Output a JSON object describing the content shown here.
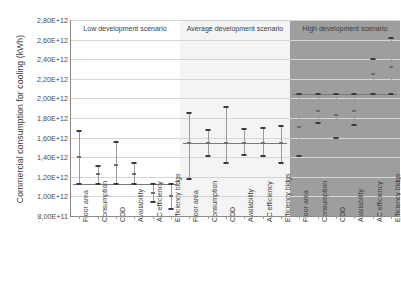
{
  "chart_data": {
    "type": "bar",
    "title": "",
    "xlabel": "",
    "ylabel": "Commercial consumption for cooling (kWh)",
    "ylim": [
      800000000000.0,
      2800000000000.0
    ],
    "ytick_labels": [
      "2,80E+12",
      "2,60E+12",
      "2,40E+12",
      "2,20E+12",
      "2,00E+12",
      "1,80E+12",
      "1,60E+12",
      "1,40E+12",
      "1,20E+12",
      "1,00E+12",
      "8,00E+11"
    ],
    "ytick_values": [
      2800000000000.0,
      2600000000000.0,
      2400000000000.0,
      2200000000000.0,
      2000000000000.0,
      1800000000000.0,
      1600000000000.0,
      1400000000000.0,
      1200000000000.0,
      1000000000000.0,
      800000000000.0
    ],
    "grid": true,
    "legend": "none",
    "categories": [
      "Floor area",
      "Consumption",
      "CDD",
      "Availability",
      "AC efficiency",
      "Efficiency bldgs"
    ],
    "panels": [
      {
        "name": "low",
        "label": "Low development scenario",
        "background": "#ffffff",
        "baseline": 1125000000000.0,
        "series": [
          {
            "category": "Floor area",
            "low": 1125000000000.0,
            "mid": 1400000000000.0,
            "high": 1665000000000.0
          },
          {
            "category": "Consumption",
            "low": 1125000000000.0,
            "mid": 1225000000000.0,
            "high": 1315000000000.0
          },
          {
            "category": "CDD",
            "low": 1125000000000.0,
            "mid": 1325000000000.0,
            "high": 1555000000000.0
          },
          {
            "category": "Availability",
            "low": 1125000000000.0,
            "mid": 1225000000000.0,
            "high": 1345000000000.0
          },
          {
            "category": "AC efficiency",
            "low": 945000000000.0,
            "mid": 1035000000000.0,
            "high": 1125000000000.0
          },
          {
            "category": "Efficiency bldgs",
            "low": 875000000000.0,
            "mid": 1005000000000.0,
            "high": 1125000000000.0
          }
        ]
      },
      {
        "name": "average",
        "label": "Average development scenario",
        "background": "#f4f4f4",
        "baseline": 1545000000000.0,
        "series": [
          {
            "category": "Floor area",
            "low": 1175000000000.0,
            "mid": 1545000000000.0,
            "high": 1855000000000.0
          },
          {
            "category": "Consumption",
            "low": 1415000000000.0,
            "mid": 1545000000000.0,
            "high": 1675000000000.0
          },
          {
            "category": "CDD",
            "low": 1345000000000.0,
            "mid": 1545000000000.0,
            "high": 1915000000000.0
          },
          {
            "category": "Availability",
            "low": 1425000000000.0,
            "mid": 1545000000000.0,
            "high": 1685000000000.0
          },
          {
            "category": "AC efficiency",
            "low": 1415000000000.0,
            "mid": 1545000000000.0,
            "high": 1695000000000.0
          },
          {
            "category": "Efficiency bldgs",
            "low": 1345000000000.0,
            "mid": 1545000000000.0,
            "high": 1715000000000.0
          }
        ]
      },
      {
        "name": "high",
        "label": "High development scenario",
        "background": "#9e9e9e",
        "baseline": 2045000000000.0,
        "series": [
          {
            "category": "Floor area",
            "low": 1415000000000.0,
            "mid": 1705000000000.0,
            "high": 2045000000000.0
          },
          {
            "category": "Consumption",
            "low": 1745000000000.0,
            "mid": 1875000000000.0,
            "high": 2045000000000.0
          },
          {
            "category": "CDD",
            "low": 1595000000000.0,
            "mid": 1835000000000.0,
            "high": 2045000000000.0
          },
          {
            "category": "Availability",
            "low": 1725000000000.0,
            "mid": 1875000000000.0,
            "high": 2045000000000.0
          },
          {
            "category": "AC efficiency",
            "low": 2045000000000.0,
            "mid": 2245000000000.0,
            "high": 2405000000000.0
          },
          {
            "category": "Efficiency bldgs",
            "low": 2045000000000.0,
            "mid": 2325000000000.0,
            "high": 2615000000000.0
          }
        ]
      }
    ]
  }
}
